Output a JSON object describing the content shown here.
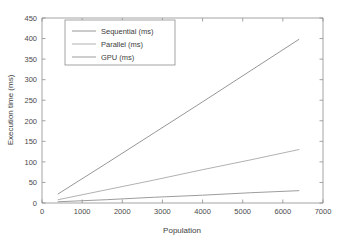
{
  "chart_data": {
    "type": "line",
    "title": "",
    "subtitle": "",
    "xlabel": "Population",
    "ylabel": "Execution time (ms)",
    "xlim": [
      0,
      7000
    ],
    "ylim": [
      0,
      450
    ],
    "xticks": [
      0,
      1000,
      2000,
      3000,
      4000,
      5000,
      6000,
      7000
    ],
    "yticks": [
      0,
      50,
      100,
      150,
      200,
      250,
      300,
      350,
      400,
      450
    ],
    "xtick_labels": [
      "0",
      "1000",
      "2000",
      "3000",
      "4000",
      "5000",
      "6000",
      "7000"
    ],
    "ytick_labels": [
      "0",
      "50",
      "100",
      "150",
      "200",
      "250",
      "300",
      "350",
      "400",
      "450"
    ],
    "grid": false,
    "legend_position": "upper-left-inset",
    "x": [
      400,
      1600,
      2800,
      4000,
      5200,
      6400
    ],
    "series": [
      {
        "name": "Sequential (ms)",
        "color": "#8a8a8a",
        "values": [
          22,
          96,
          171,
          246,
          322,
          398
        ]
      },
      {
        "name": "Parallel (ms)",
        "color": "#a8a8a8",
        "values": [
          8,
          32,
          56,
          81,
          105,
          130
        ]
      },
      {
        "name": "GPU (ms)",
        "color": "#919191",
        "values": [
          3,
          8,
          14,
          19,
          25,
          30
        ]
      }
    ]
  },
  "axes": {
    "xlabel": "Population",
    "ylabel": "Execution time (ms)"
  },
  "legend": {
    "entries": [
      {
        "label": "Sequential (ms)"
      },
      {
        "label": "Parallel (ms)"
      },
      {
        "label": "GPU (ms)"
      }
    ]
  },
  "ticks": {
    "x": [
      "0",
      "1000",
      "2000",
      "3000",
      "4000",
      "5000",
      "6000",
      "7000"
    ],
    "y": [
      "0",
      "50",
      "100",
      "150",
      "200",
      "250",
      "300",
      "350",
      "400",
      "450"
    ]
  },
  "colors": {
    "background": "#ffffff",
    "axis": "#8d8d8d",
    "text": "#3d3d3d",
    "sequential": "#8a8a8a",
    "parallel": "#a8a8a8",
    "gpu": "#919191"
  }
}
